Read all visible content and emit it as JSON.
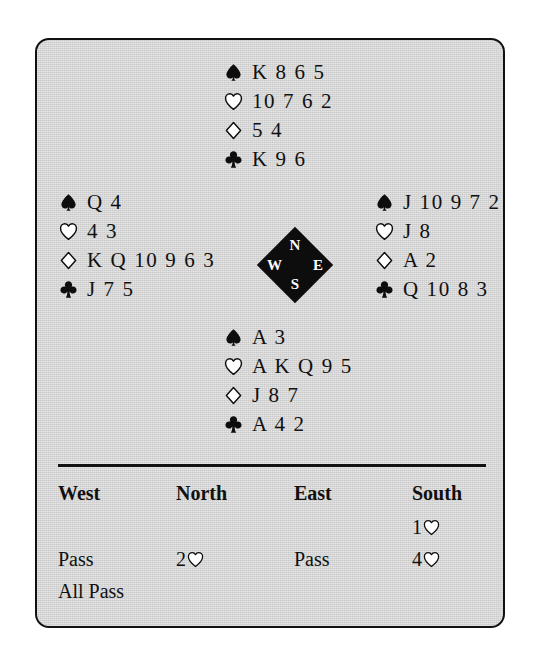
{
  "panel": {
    "background_color": "#d3d3d3",
    "border_color": "#111111"
  },
  "suits": {
    "spade": "spade-symbol",
    "heart": "heart-symbol",
    "diamond": "diamond-symbol",
    "club": "club-symbol"
  },
  "hands": {
    "north": {
      "label": "North",
      "spades": "K 8 6 5",
      "hearts": "10 7 6 2",
      "diamonds": "5 4",
      "clubs": "K 9 6"
    },
    "west": {
      "label": "West",
      "spades": "Q 4",
      "hearts": "4 3",
      "diamonds": "K Q 10 9 6 3",
      "clubs": "J 7 5"
    },
    "east": {
      "label": "East",
      "spades": "J 10 9 7 2",
      "hearts": "J 8",
      "diamonds": "A 2",
      "clubs": "Q 10 8 3"
    },
    "south": {
      "label": "South",
      "spades": "A 3",
      "hearts": "A K Q 9 5",
      "diamonds": "J 8 7",
      "clubs": "A 4 2"
    }
  },
  "compass": {
    "north": "N",
    "west": "W",
    "east": "E",
    "south": "S"
  },
  "auction": {
    "headers": [
      "West",
      "North",
      "East",
      "South"
    ],
    "rows": [
      {
        "west": "",
        "north": "",
        "east": "",
        "south_level": "1",
        "south_suit": "heart"
      },
      {
        "west": "Pass",
        "north_level": "2",
        "north_suit": "heart",
        "east": "Pass",
        "south_level": "4",
        "south_suit": "heart"
      },
      {
        "west": "All Pass",
        "north": "",
        "east": "",
        "south": ""
      }
    ]
  }
}
